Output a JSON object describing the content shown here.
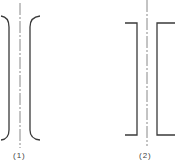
{
  "diagram": {
    "figures": [
      {
        "id": "fig1",
        "label": "(1)",
        "shape": "curved-bracket-pair"
      },
      {
        "id": "fig2",
        "label": "(2)",
        "shape": "square-bracket-pair"
      }
    ],
    "colors": {
      "stroke": "#3a3a3a",
      "centerline": "#888888"
    }
  }
}
